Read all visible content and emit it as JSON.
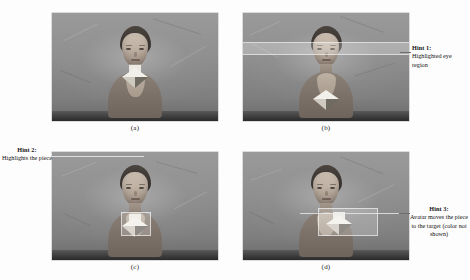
{
  "figure": {
    "type": "multi-panel-screenshot-figure",
    "layout": "2x2 grid of grayscale virtual-avatar screenshots with callout hints",
    "background_color": "#fdfdfd",
    "panel_background_color": "#8d8d8d"
  },
  "panels": [
    {
      "id": "a",
      "caption": "(a)",
      "description": "Baseline view: virtual avatar facing the camera in a gray room, holding a light-colored geometric piece at chest level. No hint highlight shown.",
      "highlight": "none"
    },
    {
      "id": "b",
      "caption": "(b)",
      "description": "Avatar with a horizontal translucent band highlighting the eye region of the face.",
      "highlight": "eye-region-band"
    },
    {
      "id": "c",
      "caption": "(c)",
      "description": "Avatar with a translucent box highlighting the geometric piece below the face.",
      "highlight": "piece-box"
    },
    {
      "id": "d",
      "caption": "(d)",
      "description": "Avatar reaching out and moving the piece toward the target location; translucent box drawn around the moved piece.",
      "highlight": "moved-piece-box"
    }
  ],
  "hints": [
    {
      "id": "hint-1",
      "title": "Hint 1:",
      "body": "Highlighted eye region",
      "target_panel": "b",
      "position": "right"
    },
    {
      "id": "hint-2",
      "title": "Hint 2:",
      "body": "Highlights the piece",
      "target_panel": "c",
      "position": "left"
    },
    {
      "id": "hint-3",
      "title": "Hint 3:",
      "body": "Avatar moves the piece to the target (color not shown)",
      "target_panel": "d",
      "position": "right"
    }
  ],
  "colors": {
    "text": "#111111",
    "leader_line": "#6e6e6e",
    "highlight_overlay": "rgba(255,255,255,0.24)",
    "piece_light_facet": "#f2f0ea",
    "piece_dark_facet": "#6f6a62"
  }
}
